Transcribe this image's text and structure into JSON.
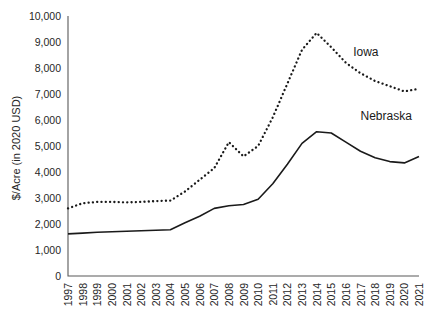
{
  "chart_data": {
    "type": "line",
    "title": "",
    "xlabel": "",
    "ylabel": "$/Acre (in 2020 USD)",
    "ylim": [
      0,
      10000
    ],
    "ytick_step": 1000,
    "ytick_labels": [
      "0",
      "1,000",
      "2,000",
      "3,000",
      "4,000",
      "5,000",
      "6,000",
      "7,000",
      "8,000",
      "9,000",
      "10,000"
    ],
    "grid": false,
    "legend_position": "inline-labels",
    "categories": [
      "1997",
      "1998",
      "1999",
      "2000",
      "2001",
      "2002",
      "2003",
      "2004",
      "2005",
      "2006",
      "2007",
      "2008",
      "2009",
      "2010",
      "2011",
      "2012",
      "2013",
      "2014",
      "2015",
      "2016",
      "2017",
      "2018",
      "2019",
      "2020",
      "2021"
    ],
    "series": [
      {
        "name": "Iowa",
        "style": "dotted",
        "color": "#1a1a1a",
        "label_x_index": 19.5,
        "label_value": 8450,
        "values": [
          2600,
          2800,
          2850,
          2850,
          2830,
          2850,
          2880,
          2900,
          3250,
          3700,
          4150,
          5150,
          4600,
          5000,
          6100,
          7400,
          8700,
          9350,
          8800,
          8200,
          7800,
          7500,
          7300,
          7100,
          7200
        ]
      },
      {
        "name": "Nebraska",
        "style": "solid",
        "color": "#1a1a1a",
        "label_x_index": 20.0,
        "label_value": 6000,
        "values": [
          1620,
          1650,
          1680,
          1700,
          1720,
          1740,
          1760,
          1780,
          2050,
          2300,
          2600,
          2700,
          2750,
          2950,
          3550,
          4300,
          5100,
          5550,
          5500,
          5150,
          4800,
          4550,
          4400,
          4350,
          4600
        ]
      }
    ]
  },
  "labels": {
    "iowa": "Iowa",
    "nebraska": "Nebraska",
    "y_axis_title": "$/Acre (in 2020 USD)"
  }
}
